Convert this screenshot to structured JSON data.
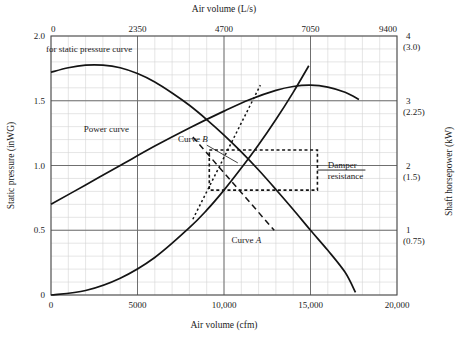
{
  "chart_data": {
    "type": "line",
    "title": "",
    "xlabel": "Air volume (cfm)",
    "xlabel_top": "Air volume (L/s)",
    "ylabel": "Static pressure (inWG)",
    "ylabel_right": "Shaft horsepower (kW)",
    "xlim": [
      0,
      20000
    ],
    "ylim": [
      0,
      2.0
    ],
    "ylim_right": [
      0,
      4
    ],
    "xlim_top": [
      0,
      9400
    ],
    "grid": true,
    "grid_minor_x": 1000,
    "grid_minor_y": 0.1,
    "legend": "none",
    "x_ticks": [
      "0",
      "5000",
      "10,000",
      "15,000",
      "20,000"
    ],
    "x_tick_values": [
      0,
      5000,
      10000,
      15000,
      20000
    ],
    "x_ticks_top": [
      "0",
      "2350",
      "4700",
      "7050",
      "9400"
    ],
    "x_tick_values_top": [
      0,
      2350,
      4700,
      7050,
      9400
    ],
    "y_ticks": [
      "0",
      "0.5",
      "1.0",
      "1.5",
      "2.0"
    ],
    "y_tick_values": [
      0,
      0.5,
      1.0,
      1.5,
      2.0
    ],
    "y_ticks_right": [
      "1",
      "2",
      "3",
      "4"
    ],
    "y_ticks_right_kw": [
      "(0.75)",
      "(1.5)",
      "(2.25)",
      "(3.0)"
    ],
    "y_tick_values_right": [
      1,
      2,
      3,
      4
    ],
    "series": [
      {
        "name": "Static pressure curve",
        "style": "solid",
        "axis": "left",
        "points": [
          [
            0,
            1.72
          ],
          [
            1000,
            1.755
          ],
          [
            2000,
            1.775
          ],
          [
            3000,
            1.775
          ],
          [
            4000,
            1.755
          ],
          [
            5000,
            1.71
          ],
          [
            6000,
            1.645
          ],
          [
            7000,
            1.56
          ],
          [
            8000,
            1.465
          ],
          [
            9000,
            1.355
          ],
          [
            10000,
            1.235
          ],
          [
            11000,
            1.105
          ],
          [
            12000,
            0.965
          ],
          [
            13000,
            0.815
          ],
          [
            14000,
            0.66
          ],
          [
            15000,
            0.5
          ],
          [
            16000,
            0.345
          ],
          [
            17000,
            0.175
          ],
          [
            17600,
            0.02
          ]
        ]
      },
      {
        "name": "Power curve",
        "style": "solid",
        "axis": "right",
        "points": [
          [
            0,
            1.4
          ],
          [
            2000,
            1.7
          ],
          [
            4000,
            2.0
          ],
          [
            6000,
            2.3
          ],
          [
            8000,
            2.58
          ],
          [
            10000,
            2.84
          ],
          [
            11500,
            3.02
          ],
          [
            13000,
            3.16
          ],
          [
            14000,
            3.22
          ],
          [
            15000,
            3.24
          ],
          [
            16000,
            3.21
          ],
          [
            17000,
            3.13
          ],
          [
            17800,
            3.02
          ]
        ]
      },
      {
        "name": "System resistance curve rising",
        "style": "solid",
        "axis": "left",
        "points": [
          [
            0,
            0.0
          ],
          [
            2000,
            0.035
          ],
          [
            4000,
            0.13
          ],
          [
            6000,
            0.29
          ],
          [
            8000,
            0.52
          ],
          [
            9000,
            0.655
          ],
          [
            10000,
            0.81
          ],
          [
            11000,
            0.98
          ],
          [
            12000,
            1.16
          ],
          [
            13000,
            1.355
          ],
          [
            14000,
            1.565
          ],
          [
            14900,
            1.77
          ]
        ]
      },
      {
        "name": "Curve A",
        "style": "dashed",
        "axis": "left",
        "points": [
          [
            8200,
            1.22
          ],
          [
            12900,
            0.5
          ]
        ]
      },
      {
        "name": "Curve B",
        "style": "dotted",
        "axis": "left",
        "points": [
          [
            8200,
            0.585
          ],
          [
            12100,
            1.62
          ]
        ]
      }
    ],
    "annotations": [
      {
        "name": "static-pressure-label",
        "text": "for static pressure curve",
        "x": 2200,
        "y": 1.88
      },
      {
        "name": "power-curve-label",
        "text": "Power curve",
        "x": 1900,
        "y": 1.26
      },
      {
        "name": "curve-b-label",
        "text": "Curve B",
        "label_italic": "B",
        "x": 8200,
        "y": 1.18
      },
      {
        "name": "curve-a-label",
        "text": "Curve A",
        "label_italic": "A",
        "x": 11300,
        "y": 0.4
      },
      {
        "name": "damper-resistance-label",
        "line1": "Damper",
        "line2": "resistance",
        "x": 16000,
        "y": 0.98
      }
    ],
    "damper_box": {
      "name": "damper-resistance-box",
      "style": "dotted",
      "x_left": 9150,
      "x_right": 15400,
      "y_top": 1.12,
      "y_bottom": 0.81
    }
  },
  "labels": {
    "top_axis_title": "Air volume (L/s)",
    "bottom_axis_title": "Air volume (cfm)",
    "left_axis_title": "Static pressure (inWG)",
    "right_axis_title": "Shaft horsepower (kW)",
    "static_pressure_note": "for static pressure curve",
    "power_curve_note": "Power curve",
    "curve_a": "Curve ",
    "curve_a_italic": "A",
    "curve_b": "Curve ",
    "curve_b_italic": "B",
    "damper_line1": "Damper",
    "damper_line2": "resistance"
  },
  "colors": {
    "curve": "#141414",
    "grid_major": "#6f6f6f",
    "grid_minor": "#d4d4d4",
    "frame": "#4a4a4a",
    "text": "#1a1a1a",
    "background": "#ffffff"
  }
}
